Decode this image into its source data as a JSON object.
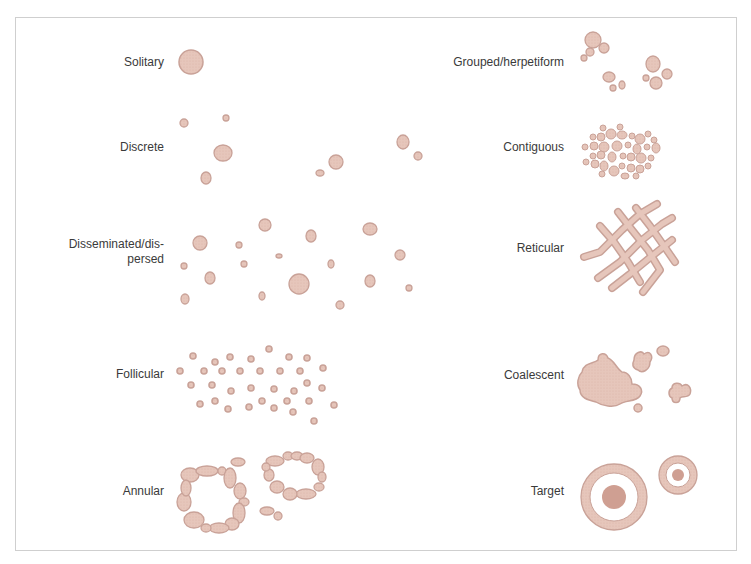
{
  "figure": {
    "colors": {
      "fill": "#e6c6bb",
      "stroke": "#c9a298",
      "dark_fill": "#cf9f92",
      "text": "#3a3a3a",
      "border": "#cfcfcf"
    },
    "patterns": [
      {
        "id": "solitary",
        "label": "Solitary",
        "column": "left",
        "label_right": 164,
        "label_y": 62
      },
      {
        "id": "discrete",
        "label": "Discrete",
        "column": "left",
        "label_right": 164,
        "label_y": 147
      },
      {
        "id": "disseminated",
        "label": "Disseminated/dis-",
        "label2": "persed",
        "column": "left",
        "label_right": 164,
        "label_y": 252
      },
      {
        "id": "follicular",
        "label": "Follicular",
        "column": "left",
        "label_right": 164,
        "label_y": 374
      },
      {
        "id": "annular",
        "label": "Annular",
        "column": "left",
        "label_right": 164,
        "label_y": 491
      },
      {
        "id": "grouped",
        "label": "Grouped/herpetiform",
        "column": "right",
        "label_right": 564,
        "label_y": 62
      },
      {
        "id": "contiguous",
        "label": "Contiguous",
        "column": "right",
        "label_right": 564,
        "label_y": 147
      },
      {
        "id": "reticular",
        "label": "Reticular",
        "column": "right",
        "label_right": 564,
        "label_y": 248
      },
      {
        "id": "coalescent",
        "label": "Coalescent",
        "column": "right",
        "label_right": 564,
        "label_y": 375
      },
      {
        "id": "target",
        "label": "Target",
        "column": "right",
        "label_right": 564,
        "label_y": 491
      }
    ]
  },
  "shapes": {
    "solitary": [
      [
        191,
        62,
        12,
        12
      ]
    ],
    "discrete": [
      [
        184,
        123,
        4,
        4
      ],
      [
        226,
        118,
        3,
        3
      ],
      [
        223,
        153,
        9,
        8
      ],
      [
        206,
        178,
        5,
        6
      ],
      [
        336,
        162,
        7,
        7
      ],
      [
        320,
        173,
        4,
        3
      ],
      [
        403,
        142,
        6,
        7
      ],
      [
        418,
        156,
        4,
        4
      ]
    ],
    "disseminated": [
      [
        200,
        243,
        7,
        7
      ],
      [
        265,
        225,
        6,
        6
      ],
      [
        311,
        236,
        5,
        6
      ],
      [
        370,
        229,
        7,
        6
      ],
      [
        239,
        245,
        3,
        3
      ],
      [
        279,
        256,
        3,
        2
      ],
      [
        184,
        266,
        3,
        3
      ],
      [
        244,
        264,
        3,
        3
      ],
      [
        331,
        264,
        3,
        4
      ],
      [
        400,
        255,
        5,
        5
      ],
      [
        210,
        278,
        5,
        6
      ],
      [
        299,
        284,
        10,
        10
      ],
      [
        370,
        281,
        5,
        6
      ],
      [
        185,
        299,
        4,
        5
      ],
      [
        262,
        296,
        3,
        4
      ],
      [
        340,
        305,
        4,
        4
      ],
      [
        409,
        288,
        3,
        3
      ]
    ],
    "follicular": [
      [
        193,
        356,
        3,
        3
      ],
      [
        215,
        362,
        3,
        3
      ],
      [
        230,
        357,
        3,
        3
      ],
      [
        251,
        359,
        3,
        3
      ],
      [
        269,
        349,
        3,
        3
      ],
      [
        289,
        357,
        3,
        3
      ],
      [
        307,
        358,
        3,
        3
      ],
      [
        180,
        371,
        3,
        3
      ],
      [
        204,
        371,
        3,
        3
      ],
      [
        222,
        371,
        3,
        3
      ],
      [
        240,
        371,
        3,
        3
      ],
      [
        260,
        371,
        3,
        3
      ],
      [
        280,
        371,
        3,
        3
      ],
      [
        300,
        371,
        3,
        3
      ],
      [
        323,
        368,
        3,
        3
      ],
      [
        191,
        385,
        3,
        3
      ],
      [
        212,
        385,
        3,
        3
      ],
      [
        231,
        391,
        3,
        3
      ],
      [
        251,
        388,
        3,
        3
      ],
      [
        274,
        389,
        3,
        3
      ],
      [
        294,
        391,
        3,
        3
      ],
      [
        307,
        383,
        3,
        3
      ],
      [
        322,
        388,
        3,
        3
      ],
      [
        200,
        404,
        3,
        3
      ],
      [
        215,
        401,
        3,
        3
      ],
      [
        228,
        409,
        3,
        3
      ],
      [
        249,
        407,
        3,
        3
      ],
      [
        262,
        401,
        3,
        3
      ],
      [
        274,
        408,
        3,
        3
      ],
      [
        287,
        401,
        3,
        3
      ],
      [
        293,
        412,
        3,
        3
      ],
      [
        309,
        401,
        3,
        3
      ],
      [
        334,
        405,
        3,
        3
      ],
      [
        314,
        421,
        3,
        3
      ]
    ],
    "annular_ring1": [
      [
        190,
        475,
        9,
        7
      ],
      [
        207,
        471,
        11,
        5
      ],
      [
        222,
        471,
        4,
        4
      ],
      [
        230,
        478,
        6,
        10
      ],
      [
        240,
        491,
        6,
        8
      ],
      [
        244,
        502,
        5,
        4
      ],
      [
        239,
        513,
        6,
        10
      ],
      [
        232,
        524,
        7,
        6
      ],
      [
        219,
        528,
        10,
        5
      ],
      [
        206,
        528,
        5,
        4
      ],
      [
        194,
        520,
        10,
        8
      ],
      [
        184,
        502,
        7,
        9
      ],
      [
        186,
        488,
        5,
        8
      ]
    ],
    "annular_ring2": [
      [
        275,
        461,
        9,
        5
      ],
      [
        288,
        456,
        5,
        4
      ],
      [
        297,
        456,
        6,
        4
      ],
      [
        307,
        458,
        7,
        5
      ],
      [
        318,
        467,
        6,
        8
      ],
      [
        322,
        477,
        4,
        5
      ],
      [
        319,
        487,
        5,
        4
      ],
      [
        306,
        494,
        10,
        5
      ],
      [
        290,
        494,
        7,
        6
      ],
      [
        277,
        487,
        7,
        6
      ],
      [
        269,
        475,
        5,
        6
      ],
      [
        266,
        467,
        4,
        4
      ]
    ],
    "annular_extra": [
      [
        238,
        462,
        7,
        4
      ],
      [
        267,
        511,
        7,
        4
      ],
      [
        278,
        516,
        4,
        4
      ]
    ],
    "grouped": [
      [
        593,
        40,
        8,
        8
      ],
      [
        604,
        48,
        5,
        5
      ],
      [
        590,
        52,
        4,
        4
      ],
      [
        584,
        58,
        3,
        3
      ],
      [
        653,
        64,
        7,
        8
      ],
      [
        667,
        74,
        5,
        5
      ],
      [
        646,
        78,
        3,
        3
      ],
      [
        656,
        83,
        6,
        6
      ],
      [
        609,
        77,
        6,
        5
      ],
      [
        622,
        85,
        3,
        4
      ],
      [
        613,
        88,
        3,
        3
      ]
    ],
    "contiguous": [
      [
        603,
        128,
        3,
        3
      ],
      [
        620,
        127,
        3,
        3
      ],
      [
        593,
        137,
        3,
        3
      ],
      [
        601,
        137,
        4,
        4
      ],
      [
        611,
        134,
        5,
        5
      ],
      [
        622,
        135,
        5,
        4
      ],
      [
        632,
        136,
        3,
        3
      ],
      [
        640,
        139,
        5,
        5
      ],
      [
        648,
        134,
        3,
        3
      ],
      [
        654,
        140,
        3,
        3
      ],
      [
        585,
        147,
        3,
        3
      ],
      [
        594,
        146,
        4,
        4
      ],
      [
        604,
        147,
        5,
        5
      ],
      [
        617,
        146,
        5,
        5
      ],
      [
        628,
        145,
        3,
        3
      ],
      [
        637,
        149,
        4,
        5
      ],
      [
        647,
        147,
        3,
        3
      ],
      [
        656,
        148,
        4,
        5
      ],
      [
        593,
        156,
        3,
        3
      ],
      [
        601,
        155,
        4,
        4
      ],
      [
        612,
        157,
        4,
        5
      ],
      [
        623,
        156,
        3,
        3
      ],
      [
        631,
        157,
        4,
        4
      ],
      [
        641,
        158,
        5,
        5
      ],
      [
        651,
        158,
        3,
        3
      ],
      [
        586,
        162,
        3,
        3
      ],
      [
        595,
        164,
        4,
        4
      ],
      [
        604,
        166,
        4,
        5
      ],
      [
        614,
        171,
        5,
        5
      ],
      [
        622,
        166,
        3,
        3
      ],
      [
        631,
        168,
        4,
        4
      ],
      [
        640,
        169,
        4,
        4
      ],
      [
        648,
        166,
        3,
        3
      ],
      [
        602,
        174,
        3,
        3
      ],
      [
        625,
        176,
        4,
        3
      ],
      [
        636,
        176,
        3,
        3
      ]
    ],
    "target_large": {
      "cx": 614,
      "cy": 497,
      "r_outer": 33,
      "r_ring_inner": 24,
      "r_center": 12
    },
    "target_small": {
      "cx": 678,
      "cy": 475,
      "r_outer": 19,
      "r_ring_inner": 12,
      "r_center": 6
    }
  }
}
